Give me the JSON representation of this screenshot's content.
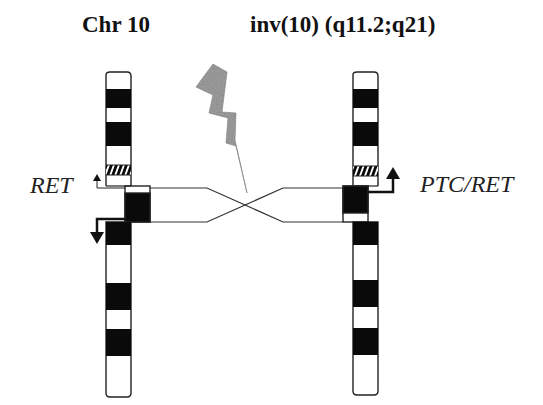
{
  "titles": {
    "left": "Chr 10",
    "right": "inv(10) (q11.2;q21)"
  },
  "labels": {
    "left_gene": "RET",
    "right_gene": "PTC/RET"
  },
  "colors": {
    "band_dark": "#0a0a0a",
    "outline": "#222222",
    "lightning": "#9a9a9a",
    "background": "#ffffff"
  },
  "diagram": {
    "chromosomes": [
      {
        "name": "normal-chr10",
        "bands_top_to_bottom": [
          "white",
          "black",
          "white",
          "black",
          "white",
          "hatched",
          "white",
          "offset-white",
          "offset-black",
          "black",
          "white",
          "black",
          "white",
          "black",
          "white"
        ]
      },
      {
        "name": "inverted-chr10",
        "bands_top_to_bottom": [
          "white",
          "black",
          "white",
          "black",
          "white",
          "hatched",
          "white",
          "offset-black",
          "offset-white",
          "black",
          "white",
          "black",
          "white",
          "black",
          "white"
        ]
      }
    ],
    "elements": [
      "lightning-bolt-breakpoint",
      "crossed-inversion-lines",
      "RET-arrows",
      "PTC-RET-arrow"
    ]
  }
}
